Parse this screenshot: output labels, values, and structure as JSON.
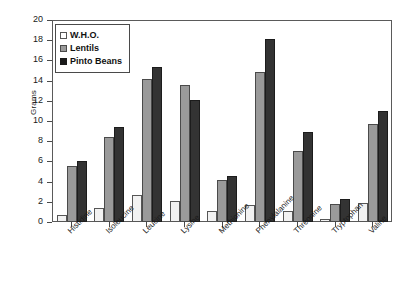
{
  "chart_data": {
    "type": "bar",
    "title": "",
    "xlabel": "",
    "ylabel": "Grams",
    "ylim": [
      0,
      20
    ],
    "yticks": [
      0,
      2,
      4,
      6,
      8,
      10,
      12,
      14,
      16,
      18,
      20
    ],
    "grid": false,
    "legend_position": "top-left",
    "categories": [
      "Histidine",
      "Isoleucine",
      "Leucine",
      "Lysine",
      "Methionine",
      "Phenylalanine",
      "Threonine",
      "Tryptophan",
      "Valine"
    ],
    "series": [
      {
        "name": "W.H.O.",
        "color": "#f2f2f2",
        "values": [
          0.7,
          1.4,
          2.65,
          2.05,
          1.05,
          1.7,
          1.05,
          0.3,
          1.85
        ]
      },
      {
        "name": "Lentils",
        "color": "#9a9a9a",
        "values": [
          5.5,
          8.4,
          14.15,
          13.6,
          4.2,
          14.9,
          7.0,
          1.8,
          9.7
        ]
      },
      {
        "name": "Pinto Beans",
        "color": "#333333",
        "values": [
          6.0,
          9.4,
          15.3,
          12.1,
          4.6,
          18.1,
          8.9,
          2.25,
          11.0
        ]
      }
    ]
  },
  "legend": {
    "items": [
      {
        "label": "W.H.O."
      },
      {
        "label": "Lentils"
      },
      {
        "label": "Pinto Beans"
      }
    ]
  },
  "axes": {
    "y_title": "Grams"
  }
}
